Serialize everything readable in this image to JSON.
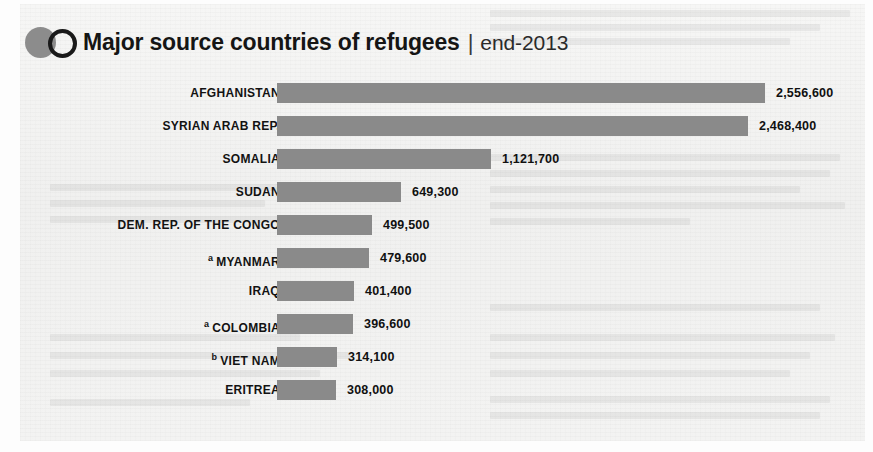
{
  "header": {
    "title_main": "Major source countries of refugees",
    "separator": "|",
    "title_sub": "end-2013",
    "logo_disc_color": "#8c8c8c",
    "logo_ring_color": "#1a1a1a"
  },
  "style": {
    "bar_color": "#8a8a8a",
    "panel_background": "#f2f2f1",
    "text_color": "#121212"
  },
  "chart_data": {
    "type": "bar",
    "orientation": "horizontal",
    "title": "Major source countries of refugees | end-2013",
    "xlabel": "",
    "ylabel": "",
    "grid": false,
    "legend": "none",
    "axis_visible": false,
    "value_labels": true,
    "xlim": [
      0,
      2556600
    ],
    "categories": [
      "AFGHANISTAN",
      "SYRIAN ARAB REP.",
      "SOMALIA",
      "SUDAN",
      "DEM. REP. OF THE CONGO",
      "MYANMAR",
      "IRAQ",
      "COLOMBIA",
      "VIET NAM",
      "ERITREA"
    ],
    "values": [
      2556600,
      2468400,
      1121700,
      649300,
      499500,
      479600,
      401400,
      396600,
      314100,
      308000
    ],
    "value_labels_text": [
      "2,556,600",
      "2,468,400",
      "1,121,700",
      "649,300",
      "499,500",
      "479,600",
      "401,400",
      "396,600",
      "314,100",
      "308,000"
    ],
    "footnote_markers": [
      "",
      "",
      "",
      "",
      "",
      "a",
      "",
      "a",
      "b",
      ""
    ]
  },
  "rows": [
    {
      "label": "AFGHANISTAN",
      "note": "",
      "value_text": "2,556,600",
      "value": 2556600
    },
    {
      "label": "SYRIAN ARAB REP.",
      "note": "",
      "value_text": "2,468,400",
      "value": 2468400
    },
    {
      "label": "SOMALIA",
      "note": "",
      "value_text": "1,121,700",
      "value": 1121700
    },
    {
      "label": "SUDAN",
      "note": "",
      "value_text": "649,300",
      "value": 649300
    },
    {
      "label": "DEM. REP. OF THE CONGO",
      "note": "",
      "value_text": "499,500",
      "value": 499500
    },
    {
      "label": "MYANMAR",
      "note": "a",
      "value_text": "479,600",
      "value": 479600
    },
    {
      "label": "IRAQ",
      "note": "",
      "value_text": "401,400",
      "value": 401400
    },
    {
      "label": "COLOMBIA",
      "note": "a",
      "value_text": "396,600",
      "value": 396600
    },
    {
      "label": "VIET NAM",
      "note": "b",
      "value_text": "314,100",
      "value": 314100
    },
    {
      "label": "ERITREA",
      "note": "",
      "value_text": "308,000",
      "value": 308000
    }
  ]
}
